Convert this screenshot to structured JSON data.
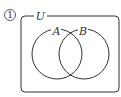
{
  "diagram": {
    "index_label": "1",
    "universe_label": "U",
    "sets": [
      {
        "label": "A"
      },
      {
        "label": "B"
      }
    ],
    "stroke_color": "#333333"
  }
}
